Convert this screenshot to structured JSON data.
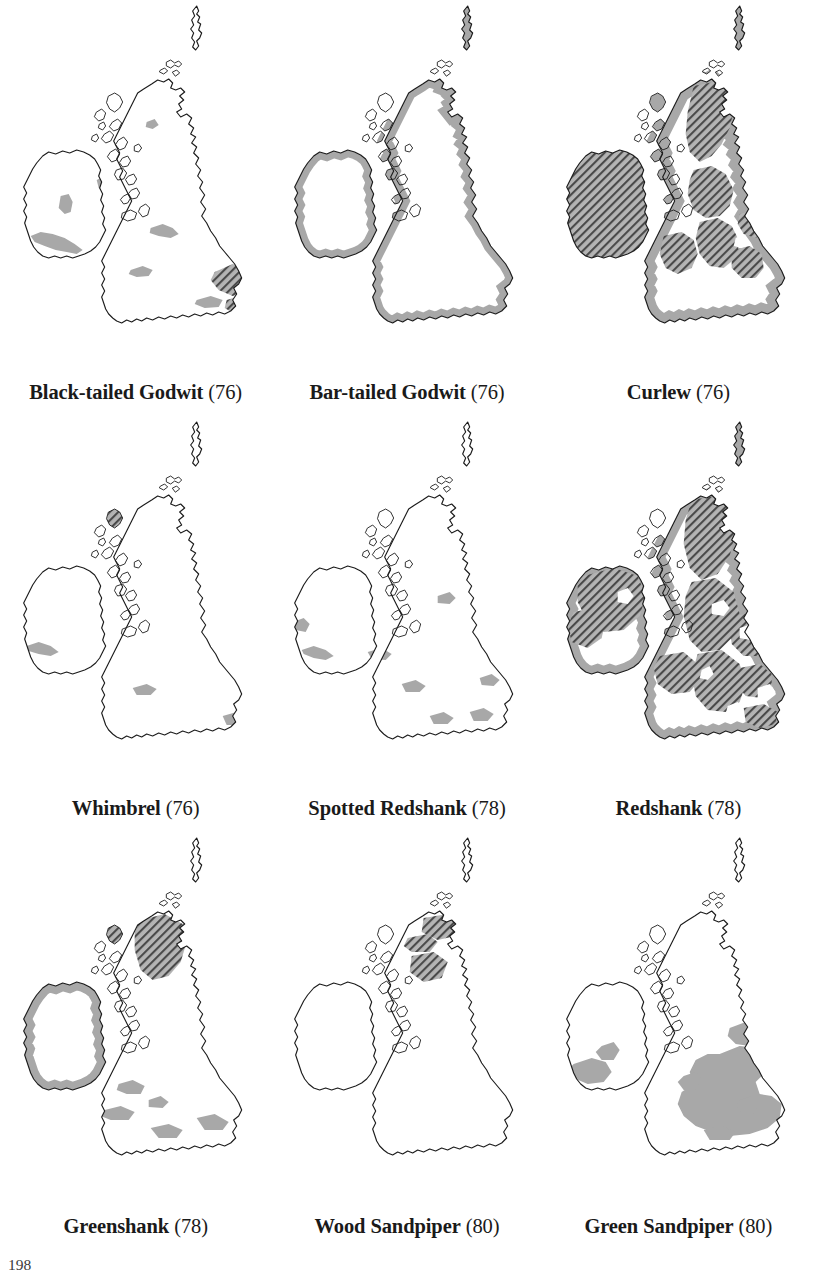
{
  "figure": {
    "folio": "198",
    "symbols": {
      "grey_fill_label": "grey-fill-range",
      "hatch_label": "diagonal-hatch-range",
      "grey_hex": "#a8a8a8",
      "hatch_hex": "#4a4a4a",
      "hatch_bg_hex": "#b4b4b4",
      "outline_hex": "#1c1c1c",
      "coast_shadow_hex": "#9a9a9a"
    },
    "base_map_name": "british-isles-outline",
    "grid": {
      "rows": 3,
      "cols": 3
    }
  },
  "maps": [
    {
      "id": "black-tailed-godwit",
      "species": "Black-tailed Godwit",
      "page_ref": "(76)",
      "row": 1,
      "col": 1,
      "has_grey": true,
      "has_hatch": true,
      "grey_regions": [
        "west Ireland coast",
        "south Ireland coast",
        "Shannon lowlands",
        "Solway",
        "Dee estuary",
        "Severn",
        "Wash margin",
        "south England coast"
      ],
      "hatch_regions": [
        "The Wash",
        "East Anglia coast",
        "Thames estuary"
      ]
    },
    {
      "id": "bar-tailed-godwit",
      "species": "Bar-tailed Godwit",
      "page_ref": "(76)",
      "row": 1,
      "col": 2,
      "has_grey": true,
      "has_hatch": false,
      "grey_regions": [
        "continuous coastal band around Ireland",
        "continuous coastal band around Great Britain",
        "Hebrides",
        "Moray Firth",
        "east England coast",
        "south England coast"
      ],
      "hatch_regions": []
    },
    {
      "id": "curlew",
      "species": "Curlew",
      "page_ref": "(76)",
      "row": 1,
      "col": 3,
      "has_grey": true,
      "has_hatch": true,
      "grey_regions": [
        "all coasts of Ireland",
        "all coasts of Great Britain",
        "Hebrides",
        "Orkney"
      ],
      "hatch_regions": [
        "all Ireland",
        "Scottish Highlands",
        "Southern Uplands",
        "Pennines",
        "Wales",
        "northern England"
      ]
    },
    {
      "id": "whimbrel",
      "species": "Whimbrel",
      "page_ref": "(76)",
      "row": 2,
      "col": 1,
      "has_grey": true,
      "has_hatch": true,
      "grey_regions": [
        "south-west Ireland coast",
        "Bristol Channel",
        "Kent coast"
      ],
      "hatch_regions": [
        "Lewis and Harris, Outer Hebrides"
      ]
    },
    {
      "id": "spotted-redshank",
      "species": "Spotted Redshank",
      "page_ref": "(78)",
      "row": 2,
      "col": 2,
      "has_grey": true,
      "has_hatch": false,
      "grey_regions": [
        "south Ireland estuaries",
        "Shannon estuary",
        "Severn estuary",
        "Solent",
        "Thames estuary",
        "The Wash",
        "Humber"
      ],
      "hatch_regions": []
    },
    {
      "id": "redshank",
      "species": "Redshank",
      "page_ref": "(78)",
      "row": 2,
      "col": 3,
      "has_grey": true,
      "has_hatch": true,
      "grey_regions": [
        "all coasts of Ireland",
        "all coasts of Great Britain"
      ],
      "hatch_regions": [
        "northern Ireland",
        "western Ireland",
        "most of Scotland",
        "northern England",
        "Wales",
        "Midlands",
        "eastern England"
      ]
    },
    {
      "id": "greenshank",
      "species": "Greenshank",
      "page_ref": "(78)",
      "row": 3,
      "col": 1,
      "has_grey": true,
      "has_hatch": true,
      "grey_regions": [
        "west and south coasts of Ireland",
        "Irish Sea coast",
        "Wales coast",
        "south-west England",
        "south coast England"
      ],
      "hatch_regions": [
        "north-west Scottish Highlands",
        "Sutherland",
        "Assynt"
      ]
    },
    {
      "id": "wood-sandpiper",
      "species": "Wood Sandpiper",
      "page_ref": "(80)",
      "row": 3,
      "col": 2,
      "has_grey": false,
      "has_hatch": true,
      "grey_regions": [],
      "hatch_regions": [
        "north-east Scottish Highlands",
        "Caithness flows",
        "Spey valley"
      ]
    },
    {
      "id": "green-sandpiper",
      "species": "Green Sandpiper",
      "page_ref": "(80)",
      "row": 3,
      "col": 3,
      "has_grey": true,
      "has_hatch": false,
      "grey_regions": [
        "southern England",
        "eastern England",
        "Midlands",
        "Welsh borders",
        "south-west Ireland"
      ],
      "hatch_regions": []
    }
  ]
}
